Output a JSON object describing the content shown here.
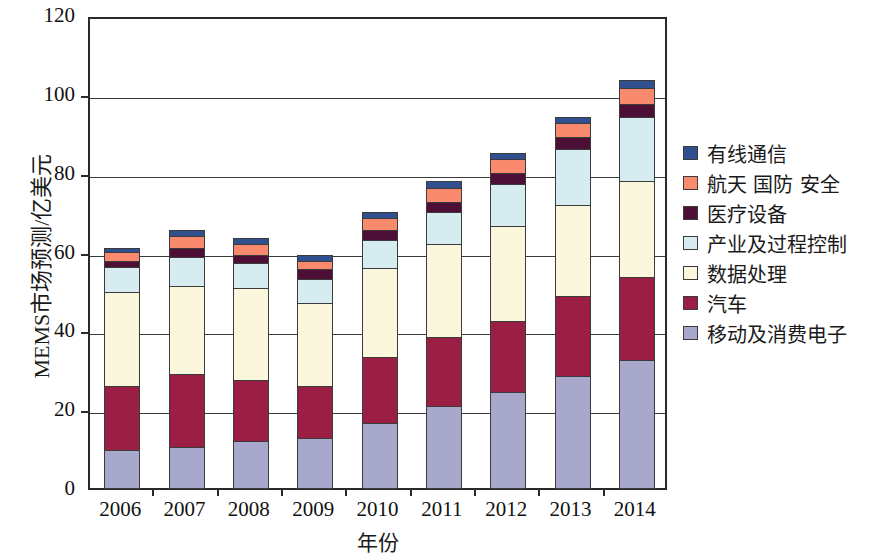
{
  "chart_data": {
    "type": "bar",
    "stacked": true,
    "title": "",
    "xlabel": "年份",
    "ylabel": "MEMS市场预测/亿美元",
    "categories": [
      "2006",
      "2007",
      "2008",
      "2009",
      "2010",
      "2011",
      "2012",
      "2013",
      "2014"
    ],
    "ylim": [
      0,
      120
    ],
    "yticks": [
      0,
      20,
      40,
      60,
      80,
      100,
      120
    ],
    "grid": true,
    "legend_position": "right",
    "series": [
      {
        "name": "移动及消费电子",
        "color": "#a8a8cc",
        "values": [
          9.6,
          10.3,
          11.8,
          12.8,
          16.6,
          20.9,
          24.4,
          28.5,
          32.5
        ]
      },
      {
        "name": "汽车",
        "color": "#9b1f45",
        "values": [
          16.4,
          18.5,
          15.7,
          13.2,
          16.6,
          17.5,
          17.9,
          20.1,
          21.0
        ]
      },
      {
        "name": "数据处理",
        "color": "#faf7dc",
        "values": [
          23.8,
          22.5,
          23.2,
          21.0,
          22.6,
          23.6,
          24.1,
          23.1,
          24.5
        ]
      },
      {
        "name": "产业及过程控制",
        "color": "#d7ecf0",
        "values": [
          6.2,
          7.2,
          6.3,
          6.0,
          7.2,
          8.0,
          10.6,
          14.3,
          16.0
        ]
      },
      {
        "name": "医疗设备",
        "color": "#4d0f35",
        "values": [
          1.5,
          2.5,
          2.0,
          2.5,
          2.5,
          2.5,
          3.0,
          3.0,
          3.5
        ]
      },
      {
        "name": "航天 国防 安全",
        "color": "#fa8a6e",
        "values": [
          2.4,
          3.0,
          3.0,
          2.0,
          3.0,
          3.5,
          3.5,
          3.5,
          4.0
        ]
      },
      {
        "name": "有线通信",
        "color": "#2f4f8f",
        "values": [
          1.1,
          1.5,
          1.5,
          1.5,
          1.5,
          2.0,
          1.5,
          1.5,
          2.0
        ]
      }
    ],
    "totals": [
      61.0,
      65.5,
      63.5,
      59.0,
      70.0,
      78.0,
      85.0,
      94.0,
      103.5
    ]
  },
  "legend": {
    "entries": [
      {
        "label": "有线通信",
        "color": "#2f4f8f"
      },
      {
        "label": "航天 国防 安全",
        "color": "#fa8a6e"
      },
      {
        "label": "医疗设备",
        "color": "#4d0f35"
      },
      {
        "label": "产业及过程控制",
        "color": "#d7ecf0"
      },
      {
        "label": "数据处理",
        "color": "#faf7dc"
      },
      {
        "label": "汽车",
        "color": "#9b1f45"
      },
      {
        "label": "移动及消费电子",
        "color": "#a8a8cc"
      }
    ]
  },
  "axes": {
    "y_title": "MEMS市场预测/亿美元",
    "x_title": "年份",
    "y_tick_labels": [
      "0",
      "20",
      "40",
      "60",
      "80",
      "100",
      "120"
    ],
    "x_tick_labels": [
      "2006",
      "2007",
      "2008",
      "2009",
      "2010",
      "2011",
      "2012",
      "2013",
      "2014"
    ]
  }
}
